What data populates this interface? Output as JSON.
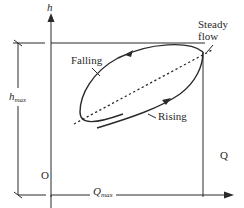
{
  "diagram": {
    "type": "rating-curve-hysteresis-loop",
    "axes": {
      "y_label": "h",
      "x_label": "Q",
      "origin_label": "O"
    },
    "dimensions": {
      "h_max": {
        "base": "h",
        "sub": "max"
      },
      "Q_max": {
        "base": "Q",
        "sub": "max"
      }
    },
    "curves": [
      {
        "name": "Falling",
        "label": "Falling",
        "style": "solid",
        "direction": "arrow pointing left along upper branch"
      },
      {
        "name": "Rising",
        "label": "Rising",
        "style": "solid",
        "direction": "arrow pointing up-right along lower branch"
      },
      {
        "name": "Steady flow",
        "label_line1": "Steady",
        "label_line2": "flow",
        "style": "dashed"
      }
    ],
    "colors": {
      "line": "#2a2a2a",
      "background": "#ffffff"
    }
  }
}
